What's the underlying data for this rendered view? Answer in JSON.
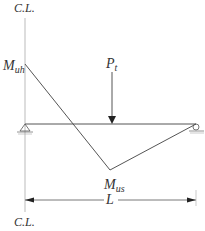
{
  "diagram": {
    "labels": {
      "centerline_top": "C.L.",
      "centerline_bottom": "C.L.",
      "moment_hogging": "M",
      "moment_hogging_sub": "uh",
      "moment_sagging": "M",
      "moment_sagging_sub": "us",
      "load": "P",
      "load_sub": "t",
      "span": "L"
    },
    "colors": {
      "line": "#555555",
      "text": "#333333",
      "centerline": "#aaaaaa"
    }
  }
}
